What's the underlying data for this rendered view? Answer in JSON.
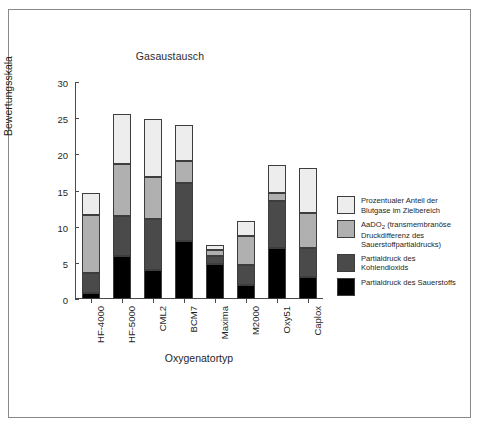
{
  "chart_data": {
    "type": "bar",
    "subtype": "stacked-bar",
    "title": "Gasaustausch",
    "xlabel": "Oxygenatortyp",
    "ylabel": "Bewertungsskala",
    "ylim": [
      0,
      30
    ],
    "yticks": [
      0,
      5,
      10,
      15,
      20,
      25,
      30
    ],
    "grid": false,
    "legend_position": "right",
    "categories": [
      "HF-4000",
      "HF-5000",
      "CML2",
      "BCM7",
      "Maxima",
      "M2000",
      "Oxy51",
      "Caplox"
    ],
    "series": [
      {
        "name": "Partialdruck des Sauerstoffs",
        "color": "#000000",
        "values": [
          0.9,
          6.0,
          4.0,
          8.0,
          4.8,
          1.9,
          7.0,
          3.1
        ]
      },
      {
        "name": "Partialdruck des Kohlendioxids",
        "color": "#4a4a4a",
        "values": [
          2.7,
          5.5,
          7.0,
          8.0,
          1.2,
          2.8,
          6.6,
          4.0
        ]
      },
      {
        "name": "AaDO2 (transmembranöse Druckdifferenz des Sauerstoffpartialdrucks)",
        "color": "#b0b0b0",
        "values": [
          8.0,
          7.1,
          5.9,
          3.1,
          0.8,
          4.0,
          1.0,
          4.8
        ]
      },
      {
        "name": "Prozentualer Anteil der Blutgase im Zielbereich",
        "color": "#ededed",
        "values": [
          3.1,
          7.0,
          8.0,
          4.9,
          0.7,
          2.1,
          3.9,
          6.2
        ]
      }
    ],
    "totals": [
      14.7,
      25.6,
      24.9,
      24.0,
      7.5,
      10.8,
      18.5,
      18.1
    ]
  },
  "legend": {
    "items": [
      {
        "label_line1": "Prozentualer Anteil der",
        "label_line2": "Blutgase im Zielbereich",
        "color": "#ededed"
      },
      {
        "label_line1": "AaDO",
        "label_sub": "2",
        "label_line1b": " (transmembranöse",
        "label_line2": "Druckdifferenz des",
        "label_line3": "Sauerstoffpartialdrucks)",
        "color": "#b0b0b0"
      },
      {
        "label_line1": "Partialdruck des",
        "label_line2": "Kohlendioxids",
        "color": "#4a4a4a"
      },
      {
        "label_line1": "Partialdruck des Sauerstoffs",
        "label_line2": "",
        "color": "#000000"
      }
    ]
  },
  "axis": {
    "y_tick_labels": [
      "30",
      "25",
      "20",
      "15",
      "10",
      "5",
      "0"
    ],
    "y_title": "Bewertungsskala",
    "x_title": "Oxygenatortyp"
  }
}
